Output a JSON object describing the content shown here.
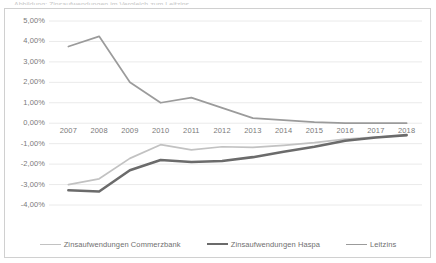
{
  "page": {
    "cut_off_header": "Abbildung: Zinsaufwendungen im Vergleich zum Leitzins"
  },
  "chart_data": {
    "type": "line",
    "title": "",
    "subtitle": "",
    "xlabel": "",
    "ylabel": "",
    "grid": true,
    "legend_position": "bottom",
    "categories": [
      "2007",
      "2008",
      "2009",
      "2010",
      "2011",
      "2012",
      "2013",
      "2014",
      "2015",
      "2016",
      "2017",
      "2018"
    ],
    "x": [
      2007,
      2008,
      2009,
      2010,
      2011,
      2012,
      2013,
      2014,
      2015,
      2016,
      2017,
      2018
    ],
    "ylim": [
      -4.0,
      5.0
    ],
    "ystep": 1.0,
    "yticks": [
      "5,00%",
      "4,00%",
      "3,00%",
      "2,00%",
      "1,00%",
      "0,00%",
      "-1,00%",
      "-2,00%",
      "-3,00%",
      "-4,00%"
    ],
    "ytick_values": [
      5.0,
      4.0,
      3.0,
      2.0,
      1.0,
      0.0,
      -1.0,
      -2.0,
      -3.0,
      -4.0
    ],
    "y_unit": "%",
    "series": [
      {
        "name": "Zinsaufwendungen Commerzbank",
        "color": "#c2c2c2",
        "width": 1.7,
        "values": [
          -3.0,
          -2.72,
          -1.72,
          -1.05,
          -1.3,
          -1.15,
          -1.18,
          -1.08,
          -0.95,
          -0.78,
          -0.68,
          -0.6
        ]
      },
      {
        "name": "Zinsaufwendungen Haspa",
        "color": "#6b6b6b",
        "width": 2.6,
        "values": [
          -3.28,
          -3.34,
          -2.3,
          -1.8,
          -1.9,
          -1.85,
          -1.66,
          -1.4,
          -1.15,
          -0.86,
          -0.7,
          -0.58
        ]
      },
      {
        "name": "Leitzins",
        "color": "#9b9b9b",
        "width": 1.7,
        "values": [
          3.75,
          4.25,
          2.0,
          1.0,
          1.25,
          0.75,
          0.25,
          0.15,
          0.05,
          0.0,
          0.0,
          0.0
        ]
      }
    ]
  },
  "legend": {
    "items": [
      {
        "label": "Zinsaufwendungen Commerzbank",
        "color": "#c2c2c2",
        "width": 1.7
      },
      {
        "label": "Zinsaufwendungen Haspa",
        "color": "#6b6b6b",
        "width": 2.8
      },
      {
        "label": "Leitzins",
        "color": "#9b9b9b",
        "width": 1.7
      }
    ]
  },
  "colors": {
    "frame": "#d0d0d0",
    "gridline": "#eaeaea",
    "tick_text": "#7a7a7a"
  }
}
